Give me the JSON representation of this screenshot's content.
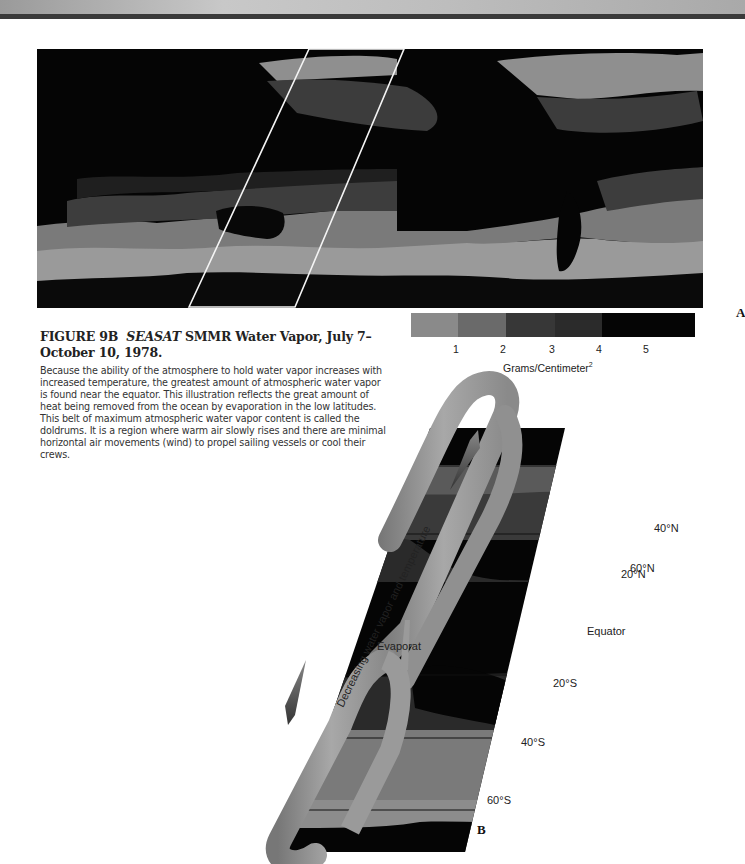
{
  "header": {
    "banner": "decorative page banner"
  },
  "figure": {
    "number": "FIGURE 9B",
    "title_italic": "SEASAT",
    "title_rest": " SMMR Water Vapor, July 7–October 10, 1978.",
    "body": "Because the ability of the atmosphere to hold water vapor increases with increased temperature, the greatest amount of atmospheric water vapor is found near the equator. This illustration reflects the great amount of heat being removed from the ocean by evaporation in the low latitudes. This belt of maximum atmospheric water vapor content is called the doldrums. It is a region where warm air slowly rises and there are minimal horizontal air movements (wind) to propel sailing vessels or cool their crews."
  },
  "panel_a": {
    "label": "A",
    "legend": {
      "colors": [
        "#8a8a8a",
        "#6a6a6a",
        "#3a3a3a",
        "#2a2a2a",
        "#050505"
      ],
      "ticks": [
        "1",
        "2",
        "3",
        "4",
        "5"
      ],
      "unit": "Grams/Centimeter",
      "unit_sup": "2"
    }
  },
  "panel_b": {
    "label": "B",
    "latitudes": [
      "60°N",
      "40°N",
      "20°N",
      "Equator",
      "20°S",
      "40°S",
      "60°S"
    ],
    "band_text": "Decreasing water vapor and temperature",
    "evap_text": "Evaporat"
  }
}
